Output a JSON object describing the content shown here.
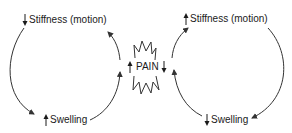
{
  "diagram": {
    "center": {
      "label": "PAIN",
      "left_indicator": "up",
      "right_indicator": "down",
      "shape": "starburst"
    },
    "left_cycle": {
      "top_node": {
        "label": "Stiffness (motion)",
        "indicator": "down"
      },
      "bottom_node": {
        "label": "Swelling",
        "indicator": "up"
      },
      "flow": "Stiffness -> Swelling -> Pain -> Stiffness"
    },
    "right_cycle": {
      "top_node": {
        "label": "Stiffness (motion)",
        "indicator": "up"
      },
      "bottom_node": {
        "label": "Swelling",
        "indicator": "down"
      },
      "flow": "Pain -> Stiffness -> Swelling -> Pain"
    },
    "colors": {
      "stroke": "#333333",
      "text": "#1a1a1a",
      "background": "#ffffff"
    }
  }
}
